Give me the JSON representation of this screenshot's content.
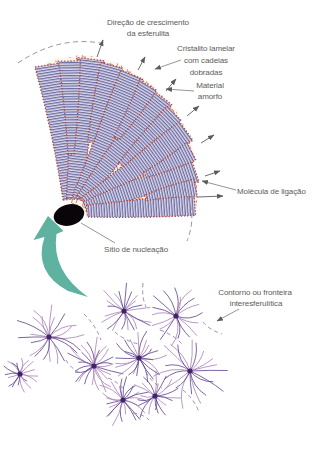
{
  "labels": {
    "growth_direction": {
      "line1": "Direção de crescimento",
      "line2": "da esferulita"
    },
    "lamellar_crystallite": {
      "line1": "Cristalito lamelar",
      "line2": "com cadeias",
      "line3": "dobradas"
    },
    "amorphous_material": {
      "line1": "Material",
      "line2": "amorfo"
    },
    "tie_molecule": {
      "text": "Molécula de ligação"
    },
    "nucleation_site": {
      "text": "Sítio de nucleação"
    },
    "interspherulitic_boundary": {
      "line1": "Contorno ou fronteira",
      "line2": "interesferulítica"
    }
  },
  "colors": {
    "label": "#5c5c5c",
    "lamella-edge": "#b5402f",
    "lamella-stripe": "#60609a",
    "lamella-bg": "#dcd9ea",
    "amorphous": "#c7503a",
    "teal": "#5fb2a0",
    "ray-dark": "#5c3d8f",
    "ray-light": "#a87fb5",
    "ray-center": "#3f2566",
    "boundary": "#9080aa",
    "nucleus": "#0a0508"
  },
  "wedge": {
    "apex": [
      72,
      212
    ],
    "nucleus": {
      "cx": 69,
      "cy": 215,
      "rx": 15.5,
      "ry": 10.5,
      "rotate": -14
    },
    "ribbons": [
      {
        "a": 99,
        "r0": 13,
        "r1": 149,
        "w0": 7,
        "w1": 14,
        "bow": 4
      },
      {
        "a": 83,
        "r0": 13,
        "r1": 154,
        "w0": 7,
        "w1": 14,
        "bow": -3
      },
      {
        "a": 67,
        "r0": 15,
        "r1": 150,
        "w0": 6,
        "w1": 13,
        "bow": 3
      },
      {
        "a": 52,
        "r0": 16,
        "r1": 146,
        "w0": 6,
        "w1": 13,
        "bow": -3
      },
      {
        "a": 36,
        "r0": 15,
        "r1": 140,
        "w0": 6,
        "w1": 13,
        "bow": 3
      },
      {
        "a": 19,
        "r0": 14,
        "r1": 130,
        "w0": 6,
        "w1": 13,
        "bow": -2
      },
      {
        "a": 4,
        "r0": 15,
        "r1": 123,
        "w0": 6,
        "w1": 12,
        "bow": 2
      }
    ],
    "branches": [
      {
        "a": 91,
        "r0": 58,
        "r1": 151,
        "w0": 3,
        "w1": 11,
        "bow": 2
      },
      {
        "a": 75,
        "r0": 72,
        "r1": 152,
        "w0": 3,
        "w1": 11,
        "bow": -2
      },
      {
        "a": 59,
        "r0": 86,
        "r1": 148,
        "w0": 3,
        "w1": 10,
        "bow": 2
      },
      {
        "a": 44,
        "r0": 68,
        "r1": 142,
        "w0": 3,
        "w1": 10,
        "bow": -2
      },
      {
        "a": 27,
        "r0": 82,
        "r1": 134,
        "w0": 3,
        "w1": 10,
        "bow": 2
      },
      {
        "a": 11,
        "r0": 76,
        "r1": 126,
        "w0": 3,
        "w1": 9,
        "bow": -2
      }
    ],
    "growth_arrows": [
      [
        97,
        57,
        103,
        40
      ],
      [
        138,
        70,
        145,
        57
      ],
      [
        166,
        91,
        176,
        79
      ],
      [
        187,
        116,
        199,
        106
      ],
      [
        201,
        143,
        214,
        135
      ],
      [
        205,
        176,
        220,
        171
      ],
      [
        198,
        197,
        223,
        196
      ]
    ]
  },
  "cluster": {
    "spherulites": [
      {
        "x": 124,
        "y": 311,
        "r": 30
      },
      {
        "x": 176,
        "y": 316,
        "r": 33
      },
      {
        "x": 49,
        "y": 337,
        "r": 36
      },
      {
        "x": 94,
        "y": 366,
        "r": 30
      },
      {
        "x": 139,
        "y": 358,
        "r": 28
      },
      {
        "x": 190,
        "y": 371,
        "r": 38
      },
      {
        "x": 123,
        "y": 400,
        "r": 27
      },
      {
        "x": 155,
        "y": 396,
        "r": 26
      },
      {
        "x": 20,
        "y": 374,
        "r": 20
      }
    ],
    "boundaries": [
      [
        143,
        283,
        146,
        307
      ],
      [
        84,
        314,
        101,
        340
      ],
      [
        115,
        332,
        138,
        344
      ],
      [
        160,
        330,
        182,
        344
      ],
      [
        203,
        322,
        222,
        334
      ],
      [
        108,
        378,
        125,
        391
      ],
      [
        146,
        372,
        162,
        388
      ],
      [
        183,
        390,
        199,
        412
      ],
      [
        66,
        360,
        82,
        374
      ],
      [
        133,
        413,
        149,
        420
      ]
    ]
  }
}
